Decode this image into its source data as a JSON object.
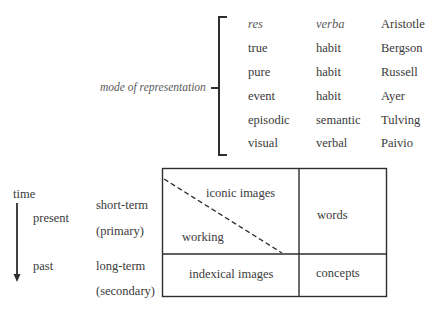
{
  "top_section": {
    "bracket_label": "mode of representation",
    "columns": [
      "col1",
      "col2",
      "col3"
    ],
    "rows": [
      {
        "c1": "res",
        "c2": "verba",
        "c3": "Aristotle",
        "italic": true
      },
      {
        "c1": "true",
        "c2": "habit",
        "c3": "Bergson"
      },
      {
        "c1": "pure",
        "c2": "habit",
        "c3": "Russell"
      },
      {
        "c1": "event",
        "c2": "habit",
        "c3": "Ayer"
      },
      {
        "c1": "episodic",
        "c2": "semantic",
        "c3": "Tulving"
      },
      {
        "c1": "visual",
        "c2": "verbal",
        "c3": "Paivio"
      }
    ]
  },
  "bottom_section": {
    "time_label": "time",
    "present_label": "present",
    "past_label": "past",
    "short_term_label": "short-term",
    "primary_label": "(primary)",
    "long_term_label": "long-term",
    "secondary_label": "(secondary)",
    "grid": {
      "iconic_images": "iconic images",
      "working": "working",
      "words": "words",
      "indexical_images": "indexical images",
      "concepts": "concepts"
    }
  },
  "colors": {
    "text": "#3a3a3a",
    "lines": "#2e2e2e",
    "background": "#ffffff"
  }
}
